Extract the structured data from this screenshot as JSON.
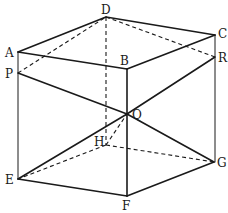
{
  "diagram": {
    "type": "geometry",
    "colors": {
      "stroke": "#1a1a1a",
      "background": "#ffffff"
    },
    "vertices": {
      "A": {
        "label": "A",
        "x": 18,
        "y": 52
      },
      "B": {
        "label": "B",
        "x": 127,
        "y": 69
      },
      "C": {
        "label": "C",
        "x": 215,
        "y": 35
      },
      "D": {
        "label": "D",
        "x": 106,
        "y": 17
      },
      "E": {
        "label": "E",
        "x": 18,
        "y": 179
      },
      "F": {
        "label": "F",
        "x": 127,
        "y": 196
      },
      "G": {
        "label": "G",
        "x": 214,
        "y": 162
      },
      "H": {
        "label": "H",
        "x": 106,
        "y": 145
      },
      "P": {
        "label": "P",
        "x": 18,
        "y": 73
      },
      "Q": {
        "label": "Q",
        "x": 127,
        "y": 114
      },
      "R": {
        "label": "R",
        "x": 215,
        "y": 57
      }
    },
    "solid_edges": [
      "A-D",
      "D-C",
      "A-B",
      "B-C",
      "A-E",
      "B-F",
      "C-G",
      "E-F",
      "F-G",
      "P-Q",
      "Q-R",
      "E-Q",
      "Q-G"
    ],
    "dashed_edges": [
      "D-H",
      "H-E",
      "H-G",
      "P-D",
      "D-R",
      "H-Q"
    ]
  }
}
